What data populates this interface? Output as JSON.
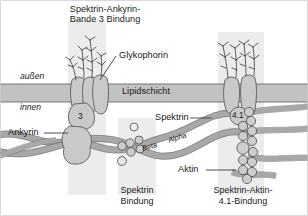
{
  "figure": {
    "title_top": "Spektrin-Ankyrin-\nBande 3 Bindung",
    "membrane_label": "Lipidschicht",
    "outside_label": "außen",
    "inside_label": "innen",
    "glycophorin_label": "Glykophorin",
    "ankyrin_label": "Ankyrin",
    "spectrin_label": "Spektrin",
    "actin_label": "Aktin",
    "band3_node": "3",
    "band41_node": "4.1",
    "beta_chain": "Beta",
    "alpha_chain": "Alpha",
    "caption_center": "Spektrin\nBindung",
    "caption_right": "Spektrin-Aktin-\n4.1-Bindung"
  },
  "colors": {
    "background": "#ffffff",
    "frame_border": "#b4b4b4",
    "membrane_fill": "#c2c2c2",
    "membrane_stroke": "#6b6b6b",
    "protein_fill": "#c9c9c9",
    "protein_stroke": "#555555",
    "spectrin_fill": "#a8a8a8",
    "spectrin_stroke": "#4d4d4d",
    "highlight_band": "#ececec",
    "bead_fill": "#cdcdcd",
    "text": "#1a1a1a",
    "leader_line": "#3a3a3a",
    "glyco_stroke": "#2e2e2e"
  },
  "layout": {
    "width": 308,
    "height": 216,
    "membrane_top": 84,
    "membrane_bottom": 102,
    "highlight_bands": [
      {
        "name": "spektrin-ankyrin-bande3",
        "x": 68,
        "w": 38
      },
      {
        "name": "spektrin-bindung",
        "x": 118,
        "w": 38
      },
      {
        "name": "spektrin-aktin-41",
        "x": 218,
        "w": 46
      }
    ]
  }
}
